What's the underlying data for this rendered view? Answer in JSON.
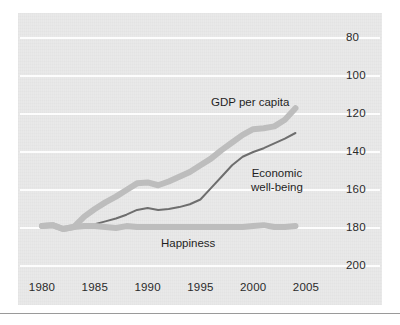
{
  "figure": {
    "background_color": "#ffffff",
    "panel_color": "#e9e9e9",
    "gridline_color": "#fdfdfd",
    "rule_color": "#9a9a9a"
  },
  "axes": {
    "y_ticks": [
      "200",
      "180",
      "160",
      "140",
      "120",
      "100",
      "80"
    ],
    "x_ticks": [
      "1980",
      "1985",
      "1990",
      "1995",
      "2000",
      "2005"
    ]
  },
  "series_labels": {
    "gdp": "GDP per capita",
    "economic_line1": "Economic",
    "economic_line2": "well-being",
    "happiness": "Happiness"
  },
  "chart_data": {
    "type": "line",
    "title": "",
    "subtitle": "",
    "xlabel": "",
    "ylabel": "",
    "xlim": [
      1980,
      2005
    ],
    "ylim": [
      80,
      200
    ],
    "grid": true,
    "grid_axis": "y",
    "legend": "inline-annotations",
    "x_ticks": [
      1980,
      1985,
      1990,
      1995,
      2000,
      2005
    ],
    "y_ticks": [
      80,
      100,
      120,
      140,
      160,
      180,
      200
    ],
    "annotations": [
      {
        "text": "GDP per capita",
        "x": 1996.5,
        "y": 168,
        "series": "GDP per capita"
      },
      {
        "text": "Economic well-being",
        "x": 1999.0,
        "y": 127,
        "series": "Economic well-being"
      },
      {
        "text": "Happiness",
        "x": 1992.0,
        "y": 94,
        "series": "Happiness"
      }
    ],
    "x": [
      1980,
      1981,
      1982,
      1983,
      1984,
      1985,
      1986,
      1987,
      1988,
      1989,
      1990,
      1991,
      1992,
      1993,
      1994,
      1995,
      1996,
      1997,
      1998,
      1999,
      2000,
      2001,
      2002,
      2003,
      2004
    ],
    "series": [
      {
        "name": "GDP per capita",
        "color": "#bdbdbd",
        "width": 6,
        "x": [
          1980,
          1981,
          1982,
          1983,
          1984,
          1985,
          1986,
          1987,
          1988,
          1989,
          1990,
          1991,
          1992,
          1993,
          1994,
          1995,
          1996,
          1997,
          1998,
          1999,
          2000,
          2001,
          2002,
          2003,
          2004
        ],
        "values": [
          101,
          101.5,
          99.5,
          100.5,
          106,
          110,
          113.5,
          116.5,
          120,
          123.5,
          124,
          122.5,
          124.5,
          127,
          129.5,
          133,
          136.5,
          141,
          145,
          149,
          152,
          152.5,
          153.5,
          157,
          163
        ]
      },
      {
        "name": "Economic well-being",
        "color": "#6e6e6e",
        "width": 2,
        "x": [
          1984,
          1985,
          1986,
          1987,
          1988,
          1989,
          1990,
          1991,
          1992,
          1993,
          1994,
          1995,
          1996,
          1997,
          1998,
          1999,
          2000,
          2001,
          2002,
          2003,
          2004
        ],
        "values": [
          101.5,
          102,
          103.5,
          105,
          107,
          109.5,
          110.5,
          109.5,
          110,
          111,
          112.5,
          115,
          121,
          127,
          133,
          137.5,
          140,
          142,
          144.5,
          147,
          150
        ]
      },
      {
        "name": "Happiness",
        "color": "#bdbdbd",
        "width": 6,
        "x": [
          1980,
          1981,
          1982,
          1983,
          1984,
          1985,
          1986,
          1987,
          1988,
          1989,
          1990,
          1991,
          1992,
          1993,
          1994,
          1995,
          1996,
          1997,
          1998,
          1999,
          2000,
          2001,
          2002,
          2003,
          2004
        ],
        "values": [
          101,
          101.5,
          99.5,
          100.5,
          101,
          101,
          100.5,
          100,
          101,
          100.5,
          100.5,
          100.5,
          100.5,
          100.5,
          100.5,
          100.5,
          100.5,
          100.5,
          100.5,
          100.5,
          101,
          101.5,
          100.5,
          100.5,
          101
        ]
      }
    ]
  }
}
